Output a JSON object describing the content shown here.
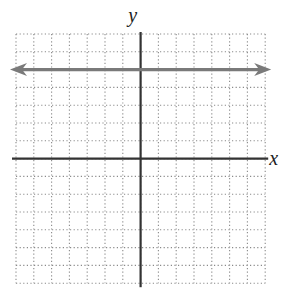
{
  "chart_data": {
    "type": "line",
    "title": "",
    "xlabel": "x",
    "ylabel": "y",
    "xlim": [
      -7,
      7
    ],
    "ylim": [
      -7,
      7
    ],
    "grid": true,
    "grid_style": "dotted",
    "tick_labels": false,
    "series": [
      {
        "name": "y = 5",
        "equation": "y = 5",
        "x": [
          -7,
          7
        ],
        "y": [
          5,
          5
        ],
        "arrows": "both",
        "color": "#7a7a7a"
      }
    ]
  },
  "labels": {
    "x_axis": "x",
    "y_axis": "y"
  },
  "colors": {
    "axis": "#333333",
    "grid": "#8a8a8a",
    "line": "#7a7a7a"
  },
  "layout": {
    "grid_left": 16,
    "grid_top": 34,
    "cell": 17.8,
    "cells": 14
  }
}
